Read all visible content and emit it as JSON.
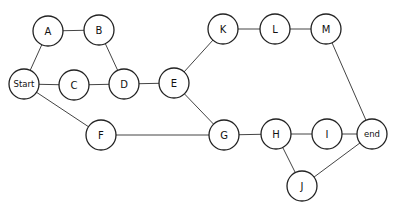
{
  "diagram": {
    "type": "graph",
    "node_radius": 15,
    "nodes": [
      {
        "id": "A",
        "label": "A",
        "x": 48,
        "y": 31
      },
      {
        "id": "B",
        "label": "B",
        "x": 99,
        "y": 30
      },
      {
        "id": "Start",
        "label": "Start",
        "x": 24,
        "y": 84
      },
      {
        "id": "C",
        "label": "C",
        "x": 74,
        "y": 85
      },
      {
        "id": "D",
        "label": "D",
        "x": 124,
        "y": 84
      },
      {
        "id": "E",
        "label": "E",
        "x": 174,
        "y": 83
      },
      {
        "id": "K",
        "label": "K",
        "x": 223,
        "y": 29
      },
      {
        "id": "L",
        "label": "L",
        "x": 275,
        "y": 29
      },
      {
        "id": "M",
        "label": "M",
        "x": 326,
        "y": 29
      },
      {
        "id": "F",
        "label": "F",
        "x": 101,
        "y": 135
      },
      {
        "id": "G",
        "label": "G",
        "x": 224,
        "y": 135
      },
      {
        "id": "H",
        "label": "H",
        "x": 276,
        "y": 134
      },
      {
        "id": "I",
        "label": "I",
        "x": 327,
        "y": 134
      },
      {
        "id": "end",
        "label": "end",
        "x": 372,
        "y": 134
      },
      {
        "id": "J",
        "label": "J",
        "x": 302,
        "y": 186
      }
    ],
    "edges": [
      [
        "Start",
        "A"
      ],
      [
        "A",
        "B"
      ],
      [
        "B",
        "D"
      ],
      [
        "Start",
        "C"
      ],
      [
        "C",
        "D"
      ],
      [
        "D",
        "E"
      ],
      [
        "E",
        "K"
      ],
      [
        "K",
        "L"
      ],
      [
        "L",
        "M"
      ],
      [
        "M",
        "end"
      ],
      [
        "E",
        "G"
      ],
      [
        "Start",
        "F"
      ],
      [
        "F",
        "G"
      ],
      [
        "G",
        "H"
      ],
      [
        "H",
        "I"
      ],
      [
        "I",
        "end"
      ],
      [
        "H",
        "J"
      ],
      [
        "J",
        "end"
      ]
    ]
  }
}
